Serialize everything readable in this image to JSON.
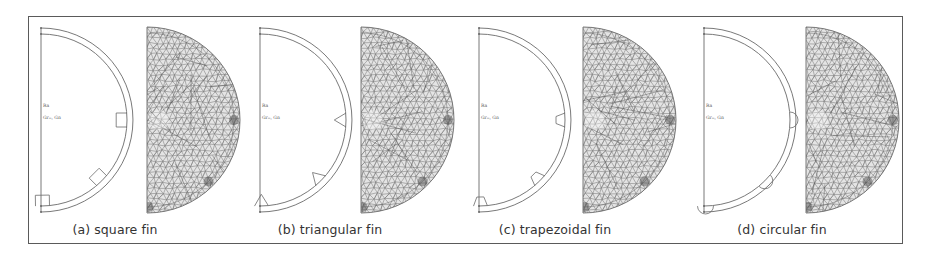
{
  "figure": {
    "panels": [
      {
        "id": "a",
        "caption": "(a) square fin",
        "fin_shape": "square",
        "outline_x": 41,
        "mesh_x": 147,
        "caption_x": 115
      },
      {
        "id": "b",
        "caption": "(b) triangular fin",
        "fin_shape": "triangular",
        "outline_x": 260,
        "mesh_x": 361,
        "caption_x": 330
      },
      {
        "id": "c",
        "caption": "(c) trapezoidal fin",
        "fin_shape": "trapezoidal",
        "outline_x": 479,
        "mesh_x": 583,
        "caption_x": 555
      },
      {
        "id": "d",
        "caption": "(d) circular fin",
        "fin_shape": "circular",
        "outline_x": 704,
        "mesh_x": 806,
        "caption_x": 782
      }
    ],
    "labels": {
      "axis_label_1": "Ra",
      "axis_label_2": "Grₘ, Gn"
    },
    "colors": {
      "frame": "#5a5a5a",
      "geometry_line": "#6a6a6a",
      "mesh_line": "#7a7a7a",
      "mesh_dark": "#444444",
      "caption_text": "#333333"
    }
  }
}
